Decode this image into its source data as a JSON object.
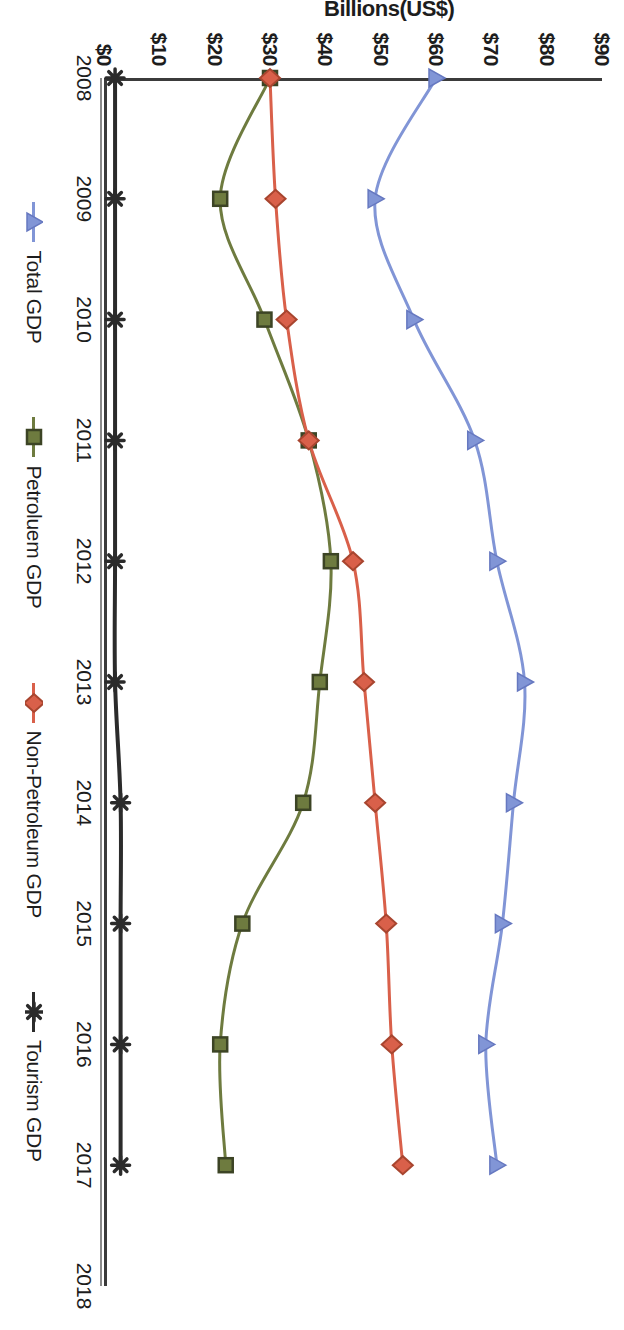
{
  "chart_data": {
    "type": "line",
    "title": "",
    "xlabel": "",
    "ylabel": "Billions(US$)",
    "x": [
      2008,
      2009,
      2010,
      2011,
      2012,
      2013,
      2014,
      2015,
      2016,
      2017
    ],
    "x_tick_labels": [
      "2008",
      "2009",
      "2010",
      "2011",
      "2012",
      "2013",
      "2014",
      "2015",
      "2016",
      "2017",
      "2018"
    ],
    "x_tick_values": [
      2008,
      2009,
      2010,
      2011,
      2012,
      2013,
      2014,
      2015,
      2016,
      2017,
      2018
    ],
    "xlim": [
      2008,
      2018
    ],
    "ylim": [
      0,
      90
    ],
    "y_tick_labels": [
      "$0",
      "$10",
      "$20",
      "$30",
      "$40",
      "$50",
      "$60",
      "$70",
      "$80",
      "$90"
    ],
    "y_tick_values": [
      0,
      10,
      20,
      30,
      40,
      50,
      60,
      70,
      80,
      90
    ],
    "grid": false,
    "legend_position": "bottom",
    "series": [
      {
        "name": "Total GDP",
        "color": "#8195d6",
        "marker": "triangle",
        "values": [
          60,
          49,
          56,
          67,
          71,
          76,
          74,
          72,
          69,
          71
        ]
      },
      {
        "name": "Petroluem GDP",
        "color": "#6e7b3f",
        "marker": "square",
        "values": [
          30,
          21,
          29,
          37,
          41,
          39,
          36,
          25,
          21,
          22
        ]
      },
      {
        "name": "Non-Petroleum GDP",
        "color": "#d9604a",
        "marker": "diamond",
        "values": [
          30,
          31,
          33,
          37,
          45,
          47,
          49,
          51,
          52,
          54
        ]
      },
      {
        "name": "Tourism GDP",
        "color": "#2b2b2b",
        "marker": "star",
        "values": [
          2,
          2,
          2,
          2,
          2,
          2,
          3,
          3,
          3,
          3
        ]
      }
    ]
  }
}
